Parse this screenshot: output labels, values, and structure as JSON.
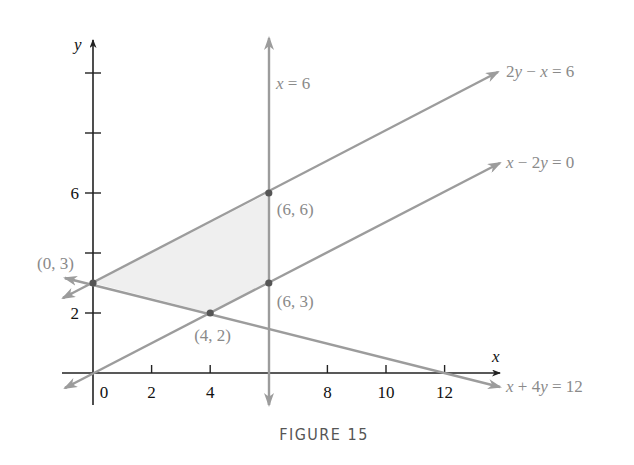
{
  "chart_data": {
    "type": "line",
    "title": "",
    "caption": "FIGURE 15",
    "xlabel": "x",
    "ylabel": "y",
    "xlim": [
      -1,
      14
    ],
    "ylim": [
      -1,
      11
    ],
    "grid": false,
    "x_ticks": [
      2,
      4,
      6,
      8,
      10,
      12
    ],
    "x_tick_labels": [
      {
        "value": 0,
        "label": "0"
      },
      {
        "value": 2,
        "label": "2"
      },
      {
        "value": 4,
        "label": "4"
      },
      {
        "value": 8,
        "label": "8"
      },
      {
        "value": 10,
        "label": "10"
      },
      {
        "value": 12,
        "label": "12"
      }
    ],
    "y_ticks": [
      2,
      4,
      6,
      8,
      10
    ],
    "y_tick_labels": [
      {
        "value": 2,
        "label": "2"
      },
      {
        "value": 6,
        "label": "6"
      }
    ],
    "lines": [
      {
        "name": "x = 6",
        "label": "x = 6",
        "kind": "vertical",
        "x": 6,
        "from": [
          6,
          -1.1
        ],
        "to": [
          6,
          11.2
        ]
      },
      {
        "name": "2y − x = 6",
        "label": "2y − x = 6",
        "from": [
          -1,
          2.5
        ],
        "to": [
          14,
          10
        ]
      },
      {
        "name": "x − 2y = 0",
        "label": "x − 2y = 0",
        "from": [
          -1,
          -0.5
        ],
        "to": [
          14,
          7
        ]
      },
      {
        "name": "x + 4y = 12",
        "label": "x + 4y = 12",
        "from": [
          -1,
          3.25
        ],
        "to": [
          14,
          -0.5
        ]
      }
    ],
    "feasible_region": {
      "vertices": [
        [
          0,
          3
        ],
        [
          6,
          6
        ],
        [
          6,
          3
        ],
        [
          4,
          2
        ]
      ],
      "fill": "#efefef"
    },
    "points": [
      {
        "x": 0,
        "y": 3,
        "label": "(0, 3)"
      },
      {
        "x": 6,
        "y": 6,
        "label": "(6, 6)"
      },
      {
        "x": 6,
        "y": 3,
        "label": "(6, 3)"
      },
      {
        "x": 4,
        "y": 2,
        "label": "(4, 2)"
      }
    ],
    "colors": {
      "axis": "#222222",
      "line": "#9c9c9c",
      "point": "#555555",
      "label": "#8a8a8a",
      "tick_label": "#111111",
      "caption": "#555555"
    }
  }
}
